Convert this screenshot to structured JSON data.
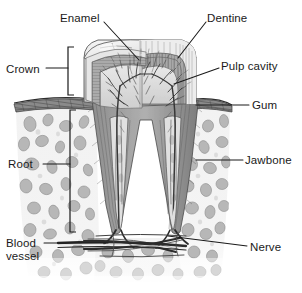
{
  "figure": {
    "style": "grayscale pencil/engraving illustration",
    "background_color": "#ffffff"
  },
  "labels": [
    {
      "id": "enamel",
      "text": "Enamel",
      "x": 60,
      "y": 12,
      "align": "left",
      "lines": 1
    },
    {
      "id": "dentine",
      "text": "Dentine",
      "x": 207,
      "y": 12,
      "align": "left",
      "lines": 1
    },
    {
      "id": "pulp-cavity",
      "text": "Pulp cavity",
      "x": 221,
      "y": 60,
      "align": "left",
      "lines": 1
    },
    {
      "id": "crown",
      "text": "Crown",
      "x": 6,
      "y": 63,
      "align": "left",
      "lines": 1
    },
    {
      "id": "gum",
      "text": "Gum",
      "x": 252,
      "y": 101,
      "align": "left",
      "lines": 1
    },
    {
      "id": "jawbone",
      "text": "Jawbone",
      "x": 245,
      "y": 155,
      "align": "left",
      "lines": 1
    },
    {
      "id": "root",
      "text": "Root",
      "x": 8,
      "y": 158,
      "align": "left",
      "lines": 1
    },
    {
      "id": "blood-vessel",
      "text": "Blood\nvessel",
      "x": 6,
      "y": 237,
      "align": "left",
      "lines": 2
    },
    {
      "id": "nerve",
      "text": "Nerve",
      "x": 250,
      "y": 243,
      "align": "left",
      "lines": 1
    }
  ],
  "leader_lines": [
    {
      "id": "enamel-leader",
      "from": [
        104,
        22
      ],
      "to": [
        139,
        60
      ]
    },
    {
      "id": "dentine-leader",
      "from": [
        206,
        22
      ],
      "to": [
        178,
        58
      ]
    },
    {
      "id": "pulp-cavity-leader",
      "from": [
        219,
        68
      ],
      "to": [
        174,
        84
      ]
    },
    {
      "id": "crown-leader",
      "from": [
        46,
        68
      ],
      "to": [
        68,
        68
      ]
    },
    {
      "id": "gum-leader",
      "from": [
        249,
        105
      ],
      "to": [
        196,
        105
      ]
    },
    {
      "id": "jawbone-leader",
      "from": [
        243,
        160
      ],
      "to": [
        196,
        160
      ]
    },
    {
      "id": "root-leader",
      "from": [
        43,
        164
      ],
      "to": [
        70,
        164
      ]
    },
    {
      "id": "blood-vessel-leader",
      "from": [
        44,
        243
      ],
      "to": [
        108,
        243
      ]
    },
    {
      "id": "nerve-leader",
      "from": [
        247,
        246
      ],
      "to": [
        168,
        236
      ]
    }
  ],
  "brackets": [
    {
      "id": "crown-bracket",
      "x": 68,
      "top": 47,
      "bottom": 95,
      "tick": 6,
      "side": "right"
    },
    {
      "id": "root-bracket",
      "x": 70,
      "top": 110,
      "bottom": 232,
      "tick": 6,
      "side": "right"
    }
  ],
  "colors": {
    "leader_line": "#1a1a1a",
    "label_text": "#1a1a1a",
    "enamel_light": "#e9e9e9",
    "enamel_mid": "#c9c9c9",
    "dentine": "#9a9a9a",
    "dentine_dark": "#6e6e6e",
    "pulp": "#dcdcdc",
    "gum_band": "#707070",
    "jawbone_fill": "#f0f0f0",
    "jawbone_cell": "#9e9e9e",
    "vessel": "#2b2b2b",
    "outline": "#4a4a4a"
  },
  "anatomy": {
    "crown": {
      "description": "Cusped tooth crown above gum line, cut-away showing layers",
      "top_y": 40,
      "bottom_y": 105,
      "left_x": 84,
      "right_x": 196
    },
    "roots": {
      "count": 2,
      "left_root_x": 113,
      "right_root_x": 160,
      "tip_y": 232
    },
    "gum_line_y": 103,
    "jawbone_region": {
      "top": 108,
      "bottom": 285,
      "left": 14,
      "right": 232
    }
  }
}
